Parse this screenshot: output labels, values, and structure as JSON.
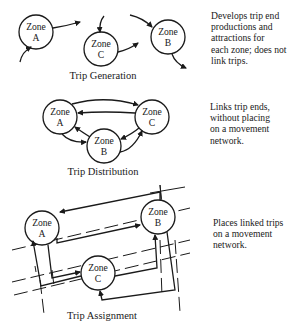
{
  "sections": [
    {
      "caption": "Trip Generation",
      "description": "Develops trip end\nproductions and\nattractions for\neach zone; does not\nlink trips."
    },
    {
      "caption": "Trip Distribution",
      "description": "Links trip ends,\nwithout placing\non a movement\nnetwork."
    },
    {
      "caption": "Trip Assignment",
      "description": "Places linked trips\non a movement\nnetwork."
    }
  ],
  "zones": {
    "word": "Zone",
    "a": "A",
    "b": "B",
    "c": "C"
  },
  "colors": {
    "ink": "#1a1a1a",
    "background": "#ffffff"
  }
}
